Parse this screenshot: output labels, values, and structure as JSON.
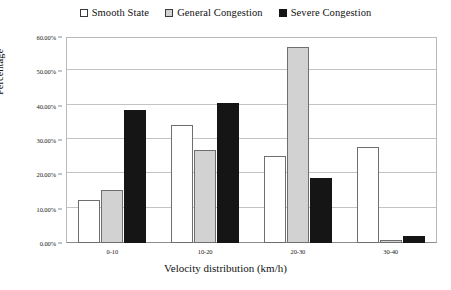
{
  "chart_data": {
    "type": "bar",
    "title": "",
    "xlabel": "Velocity distribution (km/h)",
    "ylabel": "Percentage",
    "categories": [
      "0-10",
      "10-20",
      "20-30",
      "30-40"
    ],
    "series": [
      {
        "name": "Smooth State",
        "color": "#ffffff",
        "values": [
          12.4,
          34.5,
          25.4,
          28.0
        ]
      },
      {
        "name": "General Congestion",
        "color": "#d2d2d2",
        "values": [
          15.5,
          27.0,
          57.0,
          1.0
        ]
      },
      {
        "name": "Severe Congestion",
        "color": "#151515",
        "values": [
          38.8,
          40.7,
          19.0,
          2.0
        ]
      }
    ],
    "ylim": [
      0,
      60
    ],
    "ytick_values": [
      0,
      10,
      20,
      30,
      40,
      50,
      60
    ],
    "ytick_labels": [
      "0.00%",
      "10.00%",
      "20.00%",
      "30.00%",
      "40.00%",
      "50.00%",
      "60.00%"
    ],
    "grid": true,
    "legend_position": "top-center"
  },
  "legend": {
    "entries": [
      {
        "label": "Smooth State",
        "swatch": "open-square-swatch"
      },
      {
        "label": "General Congestion",
        "swatch": "gray-square-swatch"
      },
      {
        "label": "Severe Congestion",
        "swatch": "black-square-swatch"
      }
    ]
  },
  "axes": {
    "y_title": "Percentage",
    "x_title": "Velocity distribution (km/h)"
  }
}
